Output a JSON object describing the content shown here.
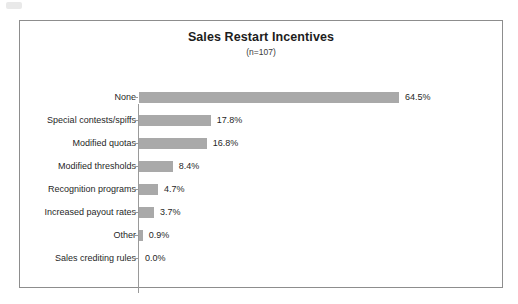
{
  "chart_data": {
    "type": "bar",
    "orientation": "horizontal",
    "title": "Sales Restart Incentives",
    "subtitle": "(n=107)",
    "xlabel": "",
    "ylabel": "",
    "xlim": [
      0,
      64.5
    ],
    "grid": false,
    "legend": "none",
    "value_suffix": "%",
    "categories": [
      "None",
      "Special contests/spiffs",
      "Modified quotas",
      "Modified thresholds",
      "Recognition programs",
      "Increased payout rates",
      "Other",
      "Sales crediting rules"
    ],
    "values": [
      64.5,
      17.8,
      16.8,
      8.4,
      4.7,
      3.7,
      0.9,
      0.0
    ],
    "value_labels": [
      "64.5%",
      "17.8%",
      "16.8%",
      "8.4%",
      "4.7%",
      "3.7%",
      "0.9%",
      "0.0%"
    ]
  },
  "style": {
    "bar_color": "#a9a9a9",
    "frame_color": "#8d8d8d",
    "axis_color": "#9a9a9a",
    "text_color": "#1f1f1f",
    "background": "#ffffff"
  }
}
